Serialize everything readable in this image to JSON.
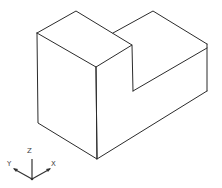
{
  "diagram": {
    "type": "isometric L-shaped block (stepped solid)",
    "line_color": "#2b2b2b",
    "background": "#ffffff"
  },
  "axis_triad": {
    "labels": {
      "x": "X",
      "y": "Y",
      "z": "Z"
    },
    "icon": "ucs-axis-icon"
  }
}
